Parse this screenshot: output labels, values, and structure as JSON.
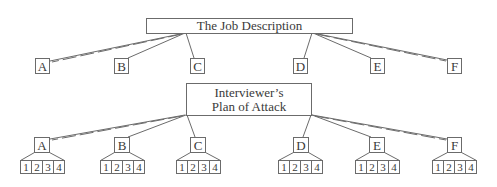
{
  "diagram": {
    "top": {
      "title": "The Job Description",
      "children": [
        "A",
        "B",
        "C",
        "D",
        "E",
        "F"
      ]
    },
    "bottom": {
      "title_line1": "Interviewer’s",
      "title_line2": "Plan of Attack",
      "children": [
        {
          "label": "A",
          "sub": [
            "1",
            "2",
            "3",
            "4"
          ]
        },
        {
          "label": "B",
          "sub": [
            "1",
            "2",
            "3",
            "4"
          ]
        },
        {
          "label": "C",
          "sub": [
            "1",
            "2",
            "3",
            "4"
          ]
        },
        {
          "label": "D",
          "sub": [
            "1",
            "2",
            "3",
            "4"
          ]
        },
        {
          "label": "E",
          "sub": [
            "1",
            "2",
            "3",
            "4"
          ]
        },
        {
          "label": "F",
          "sub": [
            "1",
            "2",
            "3",
            "4"
          ]
        }
      ]
    },
    "colors": {
      "stroke": "#6b6b6b",
      "text": "#3a3a3a",
      "background": "#ffffff"
    }
  }
}
